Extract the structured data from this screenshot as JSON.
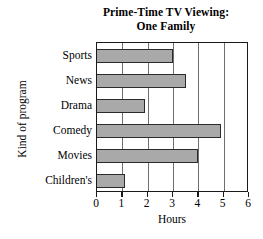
{
  "chart_data": {
    "type": "bar",
    "orientation": "horizontal",
    "title": "Prime-Time TV Viewing: One Family",
    "title_lines": [
      "Prime-Time TV Viewing:",
      "One Family"
    ],
    "categories": [
      "Sports",
      "News",
      "Drama",
      "Comedy",
      "Movies",
      "Children's"
    ],
    "values": [
      3,
      3.5,
      1.9,
      4.9,
      4,
      1.1
    ],
    "xlabel": "Hours",
    "ylabel": "Kind of program",
    "xlim": [
      0,
      6
    ],
    "xticks": [
      0,
      1,
      2,
      3,
      4,
      5,
      6
    ],
    "xtick_labels": [
      "0",
      "1",
      "2",
      "3",
      "4",
      "5",
      "6"
    ],
    "grid": "vertical",
    "legend": "none",
    "bar_color": "#a9a9a9",
    "bar_edge_color": "#2b2b2b",
    "axis_color": "#1a1a1a",
    "gridline_color": "#6e6e6e",
    "background_color": "#ffffff"
  }
}
